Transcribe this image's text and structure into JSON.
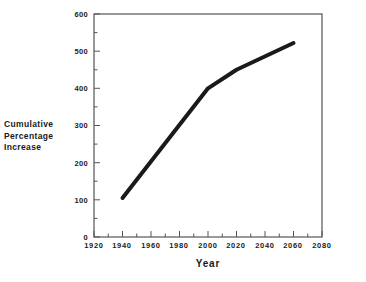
{
  "chart_data": {
    "type": "line",
    "title": "",
    "xlabel": "Year",
    "ylabel": "Cumulative Percentage Increase",
    "ylabel_lines": [
      "Cumulative",
      "Percentage",
      "Increase"
    ],
    "x": [
      1940,
      2000,
      2020,
      2060
    ],
    "values": [
      105,
      400,
      450,
      522
    ],
    "series": [
      {
        "name": "Cumulative Percentage Increase",
        "x": [
          1940,
          2000,
          2020,
          2060
        ],
        "values": [
          105,
          400,
          450,
          522
        ],
        "color": "#1a1a1a",
        "line_width": 4
      }
    ],
    "xlim": [
      1920,
      2080
    ],
    "ylim": [
      0,
      600
    ],
    "xticks": [
      1920,
      1940,
      1960,
      1980,
      2000,
      2020,
      2040,
      2060,
      2080
    ],
    "xtick_labels": [
      "1920",
      "1940",
      "1960",
      "1980",
      "2000",
      "2020",
      "2040",
      "2060",
      "2080"
    ],
    "x_minor_step": 10,
    "yticks": [
      0,
      100,
      200,
      300,
      400,
      500,
      600
    ],
    "ytick_labels": [
      "0",
      "100",
      "200",
      "300",
      "400",
      "500",
      "600"
    ],
    "y_minor_step": 50,
    "grid": false,
    "legend": "none",
    "frame": "box",
    "tick_direction": "in",
    "background": "#ffffff",
    "axis_color": "#555555"
  },
  "figure": {
    "title_remnant": "",
    "xlabel": "Year",
    "ylabel_lines": [
      "Cumulative",
      "Percentage",
      "Increase"
    ],
    "ytick_labels": [
      "600",
      "500",
      "400",
      "300",
      "200",
      "100",
      "0"
    ],
    "xtick_labels": [
      "1920",
      "1940",
      "1960",
      "1980",
      "2000",
      "2020",
      "2040",
      "2060",
      "2080"
    ]
  }
}
